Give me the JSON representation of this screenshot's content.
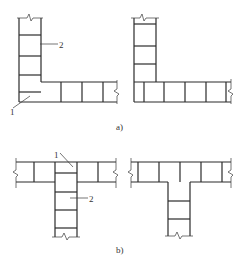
{
  "figure": {
    "subfigures": [
      {
        "id": "a",
        "caption": "a)",
        "description": "L-shaped wall corner junctions",
        "callouts": [
          {
            "number": "1",
            "target": "corner cell"
          },
          {
            "number": "2",
            "target": "vertical wall course"
          }
        ]
      },
      {
        "id": "b",
        "caption": "b)",
        "description": "T-shaped wall junctions",
        "callouts": [
          {
            "number": "1",
            "target": "junction cell"
          },
          {
            "number": "2",
            "target": "stem wall course"
          }
        ]
      }
    ],
    "colors": {
      "line": "#2a2a2a",
      "background": "#ffffff"
    }
  }
}
